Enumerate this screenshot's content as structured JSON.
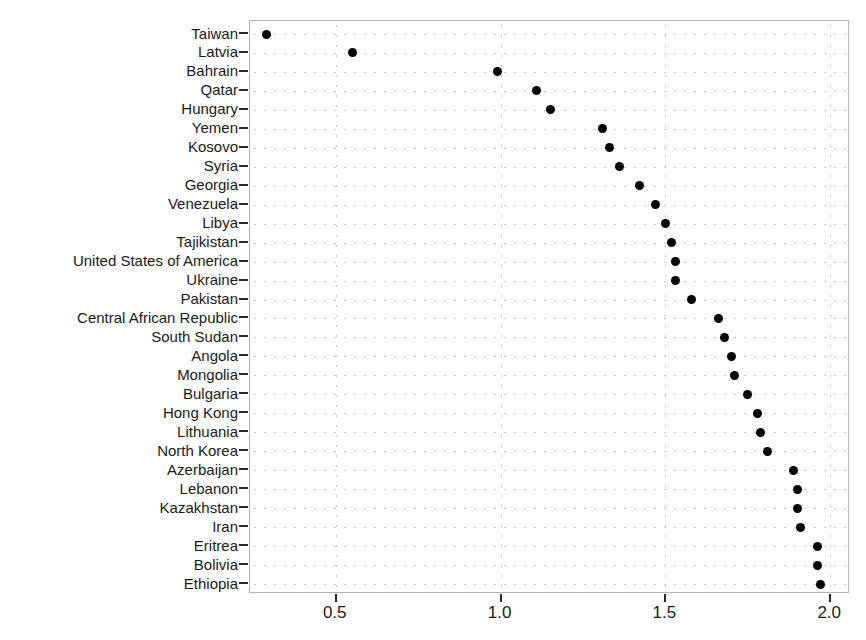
{
  "chart_data": {
    "type": "scatter",
    "title": "",
    "subtitle": "",
    "xlabel": "",
    "ylabel": "",
    "orientation": "horizontal",
    "grid": true,
    "legend": null,
    "xlim": [
      0.24,
      2.06
    ],
    "xticks": [
      0.5,
      1.0,
      1.5,
      2.0
    ],
    "xtick_labels": [
      "0.5",
      "1.0",
      "1.5",
      "2.0"
    ],
    "marker": {
      "shape": "circle",
      "color": "#000000",
      "size": 9
    },
    "panel": {
      "border_color": "#b4b4b4",
      "background": "#ffffff",
      "grid_color": "#c9c9c9"
    },
    "categories": [
      "Taiwan",
      "Latvia",
      "Bahrain",
      "Qatar",
      "Hungary",
      "Yemen",
      "Kosovo",
      "Syria",
      "Georgia",
      "Venezuela",
      "Libya",
      "Tajikistan",
      "United States of America",
      "Ukraine",
      "Pakistan",
      "Central African Republic",
      "South Sudan",
      "Angola",
      "Mongolia",
      "Bulgaria",
      "Hong Kong",
      "Lithuania",
      "North Korea",
      "Azerbaijan",
      "Lebanon",
      "Kazakhstan",
      "Iran",
      "Eritrea",
      "Bolivia",
      "Ethiopia"
    ],
    "values": [
      0.29,
      0.55,
      0.99,
      1.11,
      1.15,
      1.31,
      1.33,
      1.36,
      1.42,
      1.47,
      1.5,
      1.52,
      1.53,
      1.53,
      1.58,
      1.66,
      1.68,
      1.7,
      1.71,
      1.75,
      1.78,
      1.79,
      1.81,
      1.89,
      1.9,
      1.9,
      1.91,
      1.96,
      1.96,
      1.97
    ]
  }
}
